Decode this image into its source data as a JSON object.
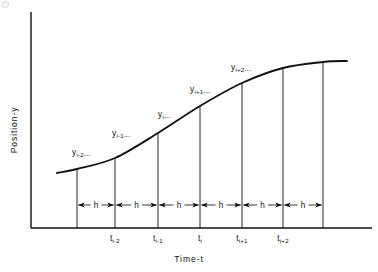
{
  "figure": {
    "kind": "annotated-diagram",
    "background_color": "#ffffff",
    "line_color": "#111111",
    "axes": {
      "x_title": "Time-t",
      "y_title": "Position-y",
      "x_axis_y_px": 228,
      "y_axis_x_px": 31,
      "x_tick_labels": [
        {
          "base": "t",
          "sub": "i-2",
          "x_px": 115
        },
        {
          "base": "t",
          "sub": "i-1",
          "x_px": 158
        },
        {
          "base": "t",
          "sub": "i",
          "x_px": 200
        },
        {
          "base": "t",
          "sub": "i+1",
          "x_px": 242
        },
        {
          "base": "t",
          "sub": "i+2",
          "x_px": 283
        }
      ]
    },
    "curve_labels": [
      {
        "base": "y",
        "sub": "i-2",
        "dashes": "---",
        "x_px": 72,
        "y_px": 155
      },
      {
        "base": "y",
        "sub": "i-1",
        "dashes": "---",
        "x_px": 112,
        "y_px": 136
      },
      {
        "base": "y",
        "sub": "i",
        "dashes": "---",
        "x_px": 158,
        "y_px": 117
      },
      {
        "base": "y",
        "sub": "i+1",
        "dashes": "---",
        "x_px": 190,
        "y_px": 92
      },
      {
        "base": "y",
        "sub": "i+2",
        "dashes": "---",
        "x_px": 231,
        "y_px": 70
      }
    ],
    "ordinate_lines_x_px": [
      77,
      115,
      158,
      200,
      242,
      283,
      323
    ],
    "step_label": "h",
    "step_intervals": [
      {
        "label": "h",
        "x0_px": 77,
        "x1_px": 115
      },
      {
        "label": "h",
        "x0_px": 115,
        "x1_px": 158
      },
      {
        "label": "h",
        "x0_px": 158,
        "x1_px": 200
      },
      {
        "label": "h",
        "x0_px": 200,
        "x1_px": 242
      },
      {
        "label": "h",
        "x0_px": 242,
        "x1_px": 283
      },
      {
        "label": "h",
        "x0_px": 283,
        "x1_px": 323
      }
    ],
    "arrow_row_y_px": 205,
    "curve_points": [
      {
        "x": 57,
        "y": 173
      },
      {
        "x": 77,
        "y": 169
      },
      {
        "x": 115,
        "y": 158
      },
      {
        "x": 158,
        "y": 133
      },
      {
        "x": 200,
        "y": 106
      },
      {
        "x": 242,
        "y": 83
      },
      {
        "x": 283,
        "y": 68
      },
      {
        "x": 323,
        "y": 62
      },
      {
        "x": 347,
        "y": 61
      }
    ]
  }
}
